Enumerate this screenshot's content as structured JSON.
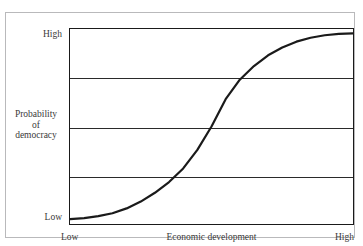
{
  "figure": {
    "title_remnant": "",
    "frame_color": "#b9b9bb",
    "background": "#ffffff",
    "axis_color": "#1a1a1a",
    "curve_color": "#1a1a1a",
    "text_color": "#3a3a3a"
  },
  "axes": {
    "y_top_label": "High",
    "y_bottom_label": "Low",
    "y_title_line1": "Probability",
    "y_title_line2": "of",
    "y_title_line3": "democracy",
    "x_left_label": "Low",
    "x_right_label": "High",
    "x_title": "Economic development"
  },
  "chart_data": {
    "type": "line",
    "title": "",
    "subtitle": "",
    "xlabel": "Economic development",
    "ylabel": "Probability of democracy",
    "xlim": [
      0,
      1
    ],
    "ylim": [
      0,
      1
    ],
    "xtick_labels": [
      "Low",
      "High"
    ],
    "ytick_labels": [
      "Low",
      "High"
    ],
    "grid": true,
    "gridlines_horizontal": [
      0.25,
      0.5,
      0.75
    ],
    "gridlines_vertical": [],
    "legend": null,
    "legend_position": "none",
    "annotations": [],
    "series": [
      {
        "name": "Probability of democracy",
        "shape": "sigmoid",
        "inflection_x": 0.5,
        "inflection_y": 0.5,
        "x": [
          0.0,
          0.05,
          0.1,
          0.15,
          0.2,
          0.25,
          0.3,
          0.35,
          0.4,
          0.45,
          0.5,
          0.55,
          0.6,
          0.65,
          0.7,
          0.75,
          0.8,
          0.85,
          0.9,
          0.95,
          1.0
        ],
        "y": [
          0.025,
          0.03,
          0.04,
          0.055,
          0.08,
          0.115,
          0.16,
          0.215,
          0.285,
          0.38,
          0.5,
          0.64,
          0.74,
          0.81,
          0.865,
          0.905,
          0.935,
          0.955,
          0.968,
          0.975,
          0.978
        ]
      }
    ]
  }
}
